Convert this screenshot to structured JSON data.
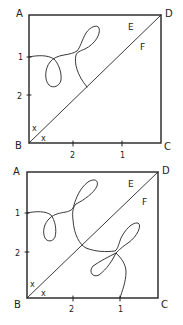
{
  "figures": [
    {
      "id": "top",
      "corners": {
        "A": "A",
        "B": "B",
        "C": "C",
        "D": "D"
      },
      "side_labels": {
        "E": "E",
        "F": "F"
      },
      "left_ticks": [
        "1",
        "2"
      ],
      "bottom_ticks": [
        "2",
        "1"
      ],
      "angle_marks": [
        "x",
        "x"
      ]
    },
    {
      "id": "bottom",
      "corners": {
        "A": "A",
        "B": "B",
        "C": "C",
        "D": "D"
      },
      "side_labels": {
        "E": "E",
        "F": "F"
      },
      "left_ticks": [
        "1",
        "2"
      ],
      "bottom_ticks": [
        "2",
        "1"
      ],
      "angle_marks": [
        "x",
        "x"
      ]
    }
  ],
  "colors": {
    "ink": "#222222",
    "background": "#ffffff"
  }
}
